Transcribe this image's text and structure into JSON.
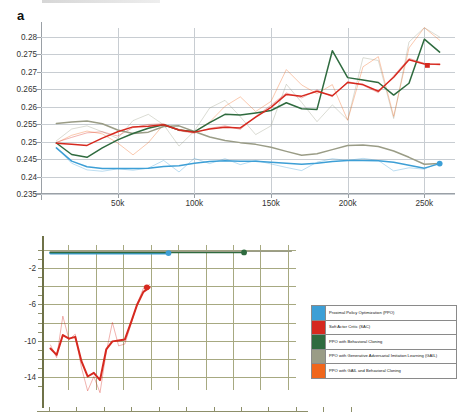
{
  "figure": {
    "panel_a_label": "a",
    "panel_b_label": "b"
  },
  "legend": {
    "items": [
      {
        "label": "Proximal Policy Optimization (PPO)",
        "color": "#3d9fd6",
        "key": "ppo"
      },
      {
        "label": "Soft Actor Critic (SAC)",
        "color": "#d6291f",
        "key": "sac"
      },
      {
        "label": "PPO with Behavioral Cloning",
        "color": "#2f6b3f",
        "key": "ppo_bc"
      },
      {
        "label": "PPO with Generative Adversarial Imitation Learning (GAIL)",
        "color": "#9a9c86",
        "key": "ppo_gail"
      },
      {
        "label": "PPO with GAIL and Behavioral Cloning",
        "color": "#f0661b",
        "key": "ppo_gail_bc"
      }
    ]
  },
  "chart_data": [
    {
      "type": "line",
      "panel": "a",
      "title": "",
      "xlabel": "",
      "ylabel": "",
      "xlim": [
        0,
        270000
      ],
      "ylim": [
        0.235,
        0.2825
      ],
      "grid": true,
      "legend_position": "external-bottom-right",
      "xticks": [
        50000,
        100000,
        150000,
        200000,
        250000
      ],
      "xticklabels": [
        "50k",
        "100k",
        "150k",
        "200k",
        "250k"
      ],
      "yticks": [
        0.235,
        0.24,
        0.245,
        0.25,
        0.255,
        0.26,
        0.265,
        0.27,
        0.275,
        0.28
      ],
      "yticklabels": [
        "0.235",
        "0.24",
        "0.245",
        "0.25",
        "0.255",
        "0.26",
        "0.265",
        "0.27",
        "0.275",
        "0.28"
      ],
      "x": [
        10000,
        20000,
        30000,
        40000,
        50000,
        60000,
        70000,
        80000,
        90000,
        100000,
        110000,
        120000,
        130000,
        140000,
        150000,
        160000,
        170000,
        180000,
        190000,
        200000,
        210000,
        220000,
        230000,
        240000,
        250000,
        260000
      ],
      "series": [
        {
          "name": "Proximal Policy Optimization (PPO)",
          "color": "#3d9fd6",
          "smoothed": [
            0.2482,
            0.2444,
            0.2428,
            0.2423,
            0.2423,
            0.2423,
            0.2424,
            0.2429,
            0.2431,
            0.2438,
            0.2443,
            0.2445,
            0.2444,
            0.2444,
            0.2441,
            0.2438,
            0.2435,
            0.2438,
            0.2443,
            0.2446,
            0.2446,
            0.2445,
            0.2441,
            0.2432,
            0.2424,
            0.2437
          ],
          "raw": [
            0.2484,
            0.2438,
            0.2419,
            0.2415,
            0.2422,
            0.2418,
            0.2424,
            0.2446,
            0.2413,
            0.2452,
            0.2437,
            0.2451,
            0.2434,
            0.2446,
            0.2436,
            0.2426,
            0.2417,
            0.2441,
            0.2451,
            0.2446,
            0.2452,
            0.2446,
            0.2416,
            0.2425,
            0.2421,
            0.2441
          ],
          "end_marker": {
            "shape": "circle",
            "x": 260000,
            "y": 0.2437
          }
        },
        {
          "name": "Soft Actor Critic (SAC)",
          "color": "#d6291f",
          "smoothed": [
            0.2495,
            0.2492,
            0.2489,
            0.251,
            0.2528,
            0.2542,
            0.2544,
            0.2548,
            0.2533,
            0.2527,
            0.2536,
            0.2541,
            0.2539,
            0.257,
            0.2598,
            0.2635,
            0.263,
            0.2644,
            0.2631,
            0.2669,
            0.2663,
            0.2644,
            0.2684,
            0.2734,
            0.2722,
            0.2721
          ],
          "raw": [
            0.2498,
            0.2512,
            0.2525,
            0.2528,
            0.2516,
            0.254,
            0.2549,
            0.2551,
            0.2531,
            0.2524,
            0.2538,
            0.2545,
            0.2535,
            0.2572,
            0.2604,
            0.2639,
            0.2625,
            0.2648,
            0.2628,
            0.2672,
            0.2661,
            0.264,
            0.2688,
            0.2738,
            0.2724,
            0.2719
          ],
          "end_marker": {
            "shape": "square",
            "x": 252000,
            "y": 0.2718
          }
        },
        {
          "name": "PPO with Behavioral Cloning",
          "color": "#2f6b3f",
          "smoothed": [
            0.2496,
            0.2463,
            0.2455,
            0.2482,
            0.2505,
            0.2523,
            0.2538,
            0.2548,
            0.2533,
            0.2528,
            0.2554,
            0.2578,
            0.2576,
            0.2582,
            0.2589,
            0.2611,
            0.2594,
            0.2592,
            0.276,
            0.2683,
            0.2676,
            0.2669,
            0.2633,
            0.2667,
            0.2793,
            0.2756
          ],
          "raw": [],
          "end_marker": null
        },
        {
          "name": "PPO with Generative Adversarial Imitation Learning (GAIL)",
          "color": "#9a9c86",
          "smoothed": [
            0.2552,
            0.2556,
            0.2559,
            0.2551,
            0.2533,
            0.2523,
            0.2527,
            0.2543,
            0.2545,
            0.2529,
            0.2513,
            0.2503,
            0.2497,
            0.2492,
            0.2484,
            0.2472,
            0.2461,
            0.2465,
            0.2477,
            0.2489,
            0.249,
            0.2486,
            0.2473,
            0.2455,
            0.2435,
            0.2437
          ],
          "raw": [
            0.2502,
            0.2536,
            0.2545,
            0.2528,
            0.2509,
            0.256,
            0.2578,
            0.2548,
            0.2487,
            0.253,
            0.2596,
            0.2618,
            0.2571,
            0.252,
            0.2545,
            0.2664,
            0.2612,
            0.2557,
            0.2605,
            0.2562,
            0.274,
            0.2732,
            0.2566,
            0.2785,
            0.2826,
            0.2799
          ],
          "end_marker": null
        },
        {
          "name": "PPO with GAIL and Behavioral Cloning",
          "color": "#f0661b",
          "smoothed": [],
          "raw": [
            0.2496,
            0.2518,
            0.253,
            0.2522,
            0.2496,
            0.2462,
            0.2497,
            0.2549,
            0.2535,
            0.2528,
            0.2556,
            0.2601,
            0.2628,
            0.2586,
            0.2615,
            0.2706,
            0.2662,
            0.2637,
            0.2663,
            0.2561,
            0.2714,
            0.2743,
            0.2572,
            0.2768,
            0.2826,
            0.279
          ],
          "end_marker": null
        }
      ]
    },
    {
      "type": "line",
      "panel": "b",
      "title": "",
      "xlabel": "",
      "ylabel": "",
      "xlim": [
        0,
        270000
      ],
      "ylim": [
        -15.5,
        0.6
      ],
      "grid": true,
      "xticks": [],
      "xticklabels": [],
      "yticks": [
        -2,
        -6,
        -10,
        -14
      ],
      "yticklabels": [
        "-2",
        "-6",
        "-10",
        "-14"
      ],
      "x": [
        10000,
        20000,
        30000,
        40000,
        50000,
        60000,
        70000,
        80000,
        90000,
        100000,
        110000,
        120000,
        130000,
        140000,
        150000,
        160000,
        170000,
        180000,
        190000,
        200000,
        210000,
        220000,
        230000,
        240000,
        250000,
        260000
      ],
      "series": [
        {
          "name": "Proximal Policy Optimization (PPO)",
          "color": "#3d9fd6",
          "smoothed": [
            -0.3,
            -0.3,
            -0.3,
            -0.3,
            -0.3,
            -0.3,
            -0.3,
            -0.3,
            -0.3,
            -0.3,
            -0.3,
            -0.3,
            -0.3
          ],
          "x_end": 135000,
          "end_marker": {
            "shape": "circle",
            "x": 135000,
            "y": -0.3
          }
        },
        {
          "name": "PPO with Behavioral Cloning",
          "color": "#2f6b3f",
          "smoothed": [
            -0.22,
            -0.22,
            -0.22,
            -0.22,
            -0.22,
            -0.22,
            -0.22,
            -0.22,
            -0.22,
            -0.22,
            -0.22,
            -0.22,
            -0.22,
            -0.22,
            -0.22,
            -0.22,
            -0.22,
            -0.22,
            -0.22,
            -0.22,
            -0.22,
            -0.22
          ],
          "x_end": 215000,
          "end_marker": {
            "shape": "circle",
            "x": 215000,
            "y": -0.22
          }
        },
        {
          "name": "PPO with Generative Adversarial Imitation Learning (GAIL)",
          "color": "#9a9c86",
          "smoothed": [
            -0.1,
            -0.1,
            -0.1,
            -0.1,
            -0.1,
            -0.1,
            -0.1,
            -0.1,
            -0.1,
            -0.1,
            -0.1,
            -0.1,
            -0.1,
            -0.1,
            -0.1,
            -0.1,
            -0.1,
            -0.1,
            -0.1,
            -0.1,
            -0.1,
            -0.1,
            -0.1,
            -0.1,
            -0.1,
            -0.1
          ],
          "x_end": 265000,
          "end_marker": null
        },
        {
          "name": "Soft Actor Critic (SAC)",
          "color": "#d6291f",
          "smoothed": [
            -10.9,
            -11.6,
            -9.4,
            -9.8,
            -9.6,
            -12.3,
            -14.0,
            -13.6,
            -14.4,
            -11.0,
            -10.1,
            -10.0,
            -9.9,
            -8.0,
            -6.0,
            -4.6,
            -4.1
          ],
          "raw": [
            -10.5,
            -11.9,
            -7.3,
            -9.9,
            -9.3,
            -13.0,
            -15.6,
            -14.0,
            -15.8,
            -11.3,
            -8.0,
            -10.6,
            -10.4,
            -8.2,
            -5.9,
            -4.2,
            -3.8
          ],
          "x_end": 115000,
          "end_marker": {
            "shape": "circle",
            "x": 112000,
            "y": -4.1
          }
        }
      ]
    }
  ]
}
